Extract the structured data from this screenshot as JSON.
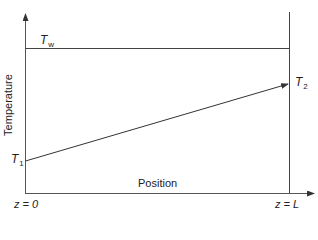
{
  "diagram": {
    "type": "temperature-vs-position profile",
    "axes": {
      "y_label": "Temperature",
      "x_label": "Position",
      "x_start_label": "z = 0",
      "x_end_label": "z = L"
    },
    "curves": {
      "wall_temperature": {
        "symbol": "T",
        "subscript": "w",
        "shape": "horizontal line"
      },
      "fluid_temperature": {
        "start": {
          "symbol": "T",
          "subscript": "1"
        },
        "end": {
          "symbol": "T",
          "subscript": "2"
        },
        "shape": "linear increase with arrow"
      }
    },
    "colors": {
      "line": "#333333",
      "text": "#222222",
      "background": "#ffffff"
    }
  }
}
